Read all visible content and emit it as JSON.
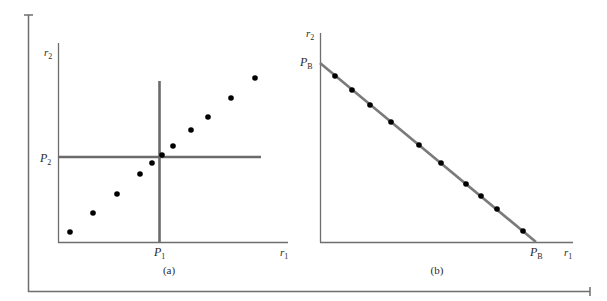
{
  "figure": {
    "frame": {
      "color": "#6e6e6e"
    },
    "panel_a": {
      "caption": "(a)",
      "y_axis_label": "r",
      "y_axis_sub": "2",
      "x_axis_label": "r",
      "x_axis_sub": "1",
      "p_y_label": "P",
      "p_y_sub": "2",
      "p_x_label": "P",
      "p_x_sub": "1",
      "axis_color": "#6e6e6e",
      "crosshair_color": "#6e6e6e",
      "point_color": "#000000",
      "points": [
        [
          70,
          232
        ],
        [
          93,
          213
        ],
        [
          117,
          194
        ],
        [
          140,
          174
        ],
        [
          152,
          163
        ],
        [
          162,
          155
        ],
        [
          173,
          146
        ],
        [
          191,
          130
        ],
        [
          208,
          117
        ],
        [
          231,
          98
        ],
        [
          255,
          78
        ]
      ]
    },
    "panel_b": {
      "caption": "(b)",
      "y_axis_label": "r",
      "y_axis_sub": "2",
      "x_axis_label": "r",
      "x_axis_sub": "1",
      "intercept_y_label": "P",
      "intercept_y_sub": "B",
      "intercept_x_label": "P",
      "intercept_x_sub": "B",
      "axis_color": "#6e6e6e",
      "line_color": "#7a7a7a",
      "point_color": "#000000",
      "points": [
        [
          335,
          76
        ],
        [
          352,
          90
        ],
        [
          370,
          105
        ],
        [
          391,
          122
        ],
        [
          419,
          145
        ],
        [
          441,
          163
        ],
        [
          466,
          184
        ],
        [
          481,
          196
        ],
        [
          497,
          209
        ],
        [
          523,
          231
        ]
      ]
    }
  }
}
